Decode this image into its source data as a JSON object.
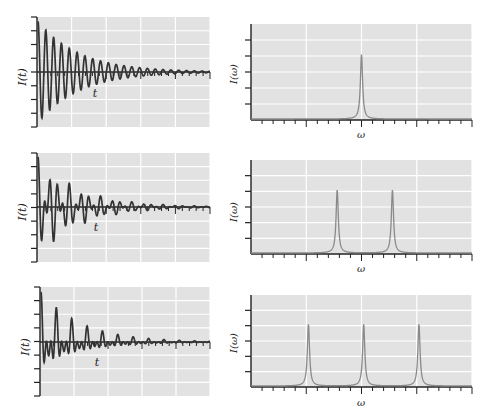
{
  "figure": {
    "background": "#ffffff",
    "plot_bg": "#e2e2e2",
    "grid_color": "#ffffff",
    "axis_color": "#222222",
    "time_trace_color": "#333333",
    "spectrum_color": "#8a8a8a"
  },
  "labels": {
    "time_ylabel": "I(t)",
    "time_xlabel": "t",
    "freq_ylabel": "I(ω)",
    "freq_xlabel": "ω"
  },
  "chart_data": [
    {
      "type": "line",
      "title": "",
      "panel": "row1-left",
      "xlabel": "t",
      "ylabel": "I(t)",
      "description": "Single-frequency exponentially decaying oscillation (FID)",
      "components": [
        {
          "frequency": 1.0,
          "amplitude": 1.0
        }
      ],
      "decay": "exponential",
      "grid": true,
      "box": {
        "x": 37,
        "y": 17,
        "w": 173,
        "h": 110,
        "zero_y": 72
      },
      "x_major_divisions": 5,
      "x_minor_per_major": 5,
      "y_divisions": 8
    },
    {
      "type": "line",
      "title": "",
      "panel": "row1-right",
      "xlabel": "ω",
      "ylabel": "I(ω)",
      "description": "Spectrum with one Lorentzian peak at the center",
      "peaks": [
        {
          "position": 0.5,
          "height": 0.67
        }
      ],
      "grid": true,
      "box": {
        "x": 251,
        "y": 24,
        "w": 221,
        "h": 96
      },
      "x_major_divisions": 4,
      "x_minor_per_major": 5,
      "y_divisions": 6
    },
    {
      "type": "line",
      "title": "",
      "panel": "row2-left",
      "xlabel": "t",
      "ylabel": "I(t)",
      "description": "Two-frequency decaying oscillation showing beats",
      "components": [
        {
          "frequency": 0.75,
          "amplitude": 0.5
        },
        {
          "frequency": 1.25,
          "amplitude": 0.5
        }
      ],
      "decay": "exponential",
      "grid": true,
      "box": {
        "x": 37,
        "y": 153,
        "w": 173,
        "h": 109,
        "zero_y": 207
      },
      "x_major_divisions": 5,
      "x_minor_per_major": 5,
      "y_divisions": 8
    },
    {
      "type": "line",
      "title": "",
      "panel": "row2-right",
      "xlabel": "ω",
      "ylabel": "I(ω)",
      "description": "Spectrum with two Lorentzian peaks",
      "peaks": [
        {
          "position": 0.39,
          "height": 0.67
        },
        {
          "position": 0.64,
          "height": 0.67
        }
      ],
      "grid": true,
      "box": {
        "x": 251,
        "y": 160,
        "w": 221,
        "h": 94
      },
      "x_major_divisions": 4,
      "x_minor_per_major": 5,
      "y_divisions": 6
    },
    {
      "type": "line",
      "title": "",
      "panel": "row3-left",
      "xlabel": "t",
      "ylabel": "I(t)",
      "description": "Three-frequency decaying oscillation with complex beats",
      "components": [
        {
          "frequency": 0.5,
          "amplitude": 0.333
        },
        {
          "frequency": 1.0,
          "amplitude": 0.333
        },
        {
          "frequency": 1.5,
          "amplitude": 0.333
        }
      ],
      "decay": "exponential",
      "grid": true,
      "box": {
        "x": 40,
        "y": 287,
        "w": 170,
        "h": 109,
        "zero_y": 342
      },
      "x_major_divisions": 5,
      "x_minor_per_major": 5,
      "y_divisions": 8
    },
    {
      "type": "line",
      "title": "",
      "panel": "row3-right",
      "xlabel": "ω",
      "ylabel": "I(ω)",
      "description": "Spectrum with three Lorentzian peaks",
      "peaks": [
        {
          "position": 0.26,
          "height": 0.67
        },
        {
          "position": 0.51,
          "height": 0.67
        },
        {
          "position": 0.76,
          "height": 0.67
        }
      ],
      "grid": true,
      "box": {
        "x": 251,
        "y": 295,
        "w": 221,
        "h": 92
      },
      "x_major_divisions": 4,
      "x_minor_per_major": 5,
      "y_divisions": 6
    }
  ]
}
